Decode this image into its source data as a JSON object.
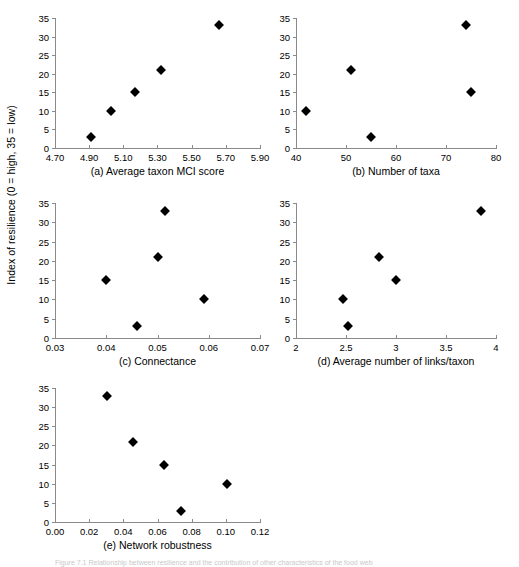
{
  "figure": {
    "ylabel": "Index of resilience (0 = high, 35 = low)",
    "caption": "Figure 7.1  Relationship between resilience and the contribution of other characteristics of the food web"
  },
  "chart_data": [
    {
      "type": "scatter",
      "title": "(a) Average taxon MCI score",
      "xlabel": "Average taxon MCI score",
      "ylabel": "Index of resilience (0 = high, 35 = low)",
      "xlim": [
        4.7,
        5.9
      ],
      "ylim": [
        0,
        35
      ],
      "xticks": [
        "4.70",
        "4.90",
        "5.10",
        "5.30",
        "5.50",
        "5.70",
        "5.90"
      ],
      "xtick_values": [
        4.7,
        4.9,
        5.1,
        5.3,
        5.5,
        5.7,
        5.9
      ],
      "yticks": [
        "0",
        "5",
        "10",
        "15",
        "20",
        "25",
        "30",
        "35"
      ],
      "ytick_values": [
        0,
        5,
        10,
        15,
        20,
        25,
        30,
        35
      ],
      "grid": false,
      "legend": "none",
      "marker": "diamond",
      "marker_color": "#000000",
      "points": [
        {
          "x": 4.91,
          "y": 3
        },
        {
          "x": 5.03,
          "y": 10
        },
        {
          "x": 5.17,
          "y": 15
        },
        {
          "x": 5.32,
          "y": 21
        },
        {
          "x": 5.66,
          "y": 33
        }
      ]
    },
    {
      "type": "scatter",
      "title": "(b) Number of taxa",
      "xlabel": "Number of taxa",
      "ylabel": "Index of resilience (0 = high, 35 = low)",
      "xlim": [
        40,
        80
      ],
      "ylim": [
        0,
        35
      ],
      "xticks": [
        "40",
        "50",
        "60",
        "70",
        "80"
      ],
      "xtick_values": [
        40,
        50,
        60,
        70,
        80
      ],
      "yticks": [
        "0",
        "5",
        "10",
        "15",
        "20",
        "25",
        "30",
        "35"
      ],
      "ytick_values": [
        0,
        5,
        10,
        15,
        20,
        25,
        30,
        35
      ],
      "grid": false,
      "legend": "none",
      "marker": "diamond",
      "marker_color": "#000000",
      "points": [
        {
          "x": 42,
          "y": 10
        },
        {
          "x": 51,
          "y": 21
        },
        {
          "x": 55,
          "y": 3
        },
        {
          "x": 74,
          "y": 33
        },
        {
          "x": 75,
          "y": 15
        }
      ]
    },
    {
      "type": "scatter",
      "title": "(c) Connectance",
      "xlabel": "Connectance",
      "ylabel": "Index of resilience (0 = high, 35 = low)",
      "xlim": [
        0.03,
        0.07
      ],
      "ylim": [
        0,
        35
      ],
      "xticks": [
        "0.03",
        "0.04",
        "0.05",
        "0.06",
        "0.07"
      ],
      "xtick_values": [
        0.03,
        0.04,
        0.05,
        0.06,
        0.07
      ],
      "yticks": [
        "0",
        "5",
        "10",
        "15",
        "20",
        "25",
        "30",
        "35"
      ],
      "ytick_values": [
        0,
        5,
        10,
        15,
        20,
        25,
        30,
        35
      ],
      "grid": false,
      "legend": "none",
      "marker": "diamond",
      "marker_color": "#000000",
      "points": [
        {
          "x": 0.04,
          "y": 15
        },
        {
          "x": 0.046,
          "y": 3
        },
        {
          "x": 0.05,
          "y": 21
        },
        {
          "x": 0.0515,
          "y": 33
        },
        {
          "x": 0.059,
          "y": 10
        }
      ]
    },
    {
      "type": "scatter",
      "title": "(d) Average number of links/taxon",
      "xlabel": "Average number of links/taxon",
      "ylabel": "Index of resilience (0 = high, 35 = low)",
      "xlim": [
        2,
        4
      ],
      "ylim": [
        0,
        35
      ],
      "xticks": [
        "2",
        "2.5",
        "3",
        "3.5",
        "4"
      ],
      "xtick_values": [
        2,
        2.5,
        3,
        3.5,
        4
      ],
      "yticks": [
        "0",
        "5",
        "10",
        "15",
        "20",
        "25",
        "30",
        "35"
      ],
      "ytick_values": [
        0,
        5,
        10,
        15,
        20,
        25,
        30,
        35
      ],
      "grid": false,
      "legend": "none",
      "marker": "diamond",
      "marker_color": "#000000",
      "points": [
        {
          "x": 2.47,
          "y": 10
        },
        {
          "x": 2.52,
          "y": 3
        },
        {
          "x": 2.83,
          "y": 21
        },
        {
          "x": 3.0,
          "y": 15
        },
        {
          "x": 3.85,
          "y": 33
        }
      ]
    },
    {
      "type": "scatter",
      "title": "(e) Network  robustness",
      "xlabel": "Network robustness",
      "ylabel": "Index of resilience (0 = high, 35 = low)",
      "xlim": [
        0.0,
        0.12
      ],
      "ylim": [
        0,
        35
      ],
      "xticks": [
        "0.00",
        "0.02",
        "0.04",
        "0.06",
        "0.08",
        "0.10",
        "0.12"
      ],
      "xtick_values": [
        0.0,
        0.02,
        0.04,
        0.06,
        0.08,
        0.1,
        0.12
      ],
      "yticks": [
        "0",
        "5",
        "10",
        "15",
        "20",
        "25",
        "30",
        "35"
      ],
      "ytick_values": [
        0,
        5,
        10,
        15,
        20,
        25,
        30,
        35
      ],
      "grid": false,
      "legend": "none",
      "marker": "diamond",
      "marker_color": "#000000",
      "points": [
        {
          "x": 0.0305,
          "y": 33
        },
        {
          "x": 0.0455,
          "y": 21
        },
        {
          "x": 0.064,
          "y": 15
        },
        {
          "x": 0.0735,
          "y": 3
        },
        {
          "x": 0.1005,
          "y": 10
        }
      ]
    }
  ]
}
